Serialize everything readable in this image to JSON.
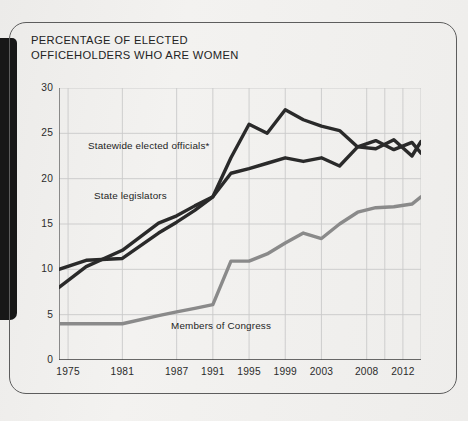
{
  "figure": {
    "title": "PERCENTAGE OF ELECTED\nOFFICEHOLDERS WHO ARE WOMEN",
    "title_line1": "PERCENTAGE OF ELECTED",
    "title_line2": "OFFICEHOLDERS WHO ARE WOMEN"
  },
  "labels": {
    "statewide": "Statewide elected officials*",
    "legislators": "State legislators",
    "congress": "Members of Congress"
  },
  "colors": {
    "dark_line": "#2a2a2a",
    "gray_line": "#8a8a8a",
    "grid": "#c9c9c9",
    "axis": "#6f6f6f",
    "text": "#232323",
    "left_block": "#171717",
    "card_border": "#5d5d5d",
    "background": "#f0efed"
  },
  "chart_data": {
    "type": "line",
    "title": "PERCENTAGE OF ELECTED OFFICEHOLDERS WHO ARE WOMEN",
    "xlabel": "",
    "ylabel": "",
    "xlim": [
      1974,
      2014
    ],
    "ylim": [
      0,
      30
    ],
    "ytick_values": [
      0,
      5,
      10,
      15,
      20,
      25,
      30
    ],
    "ytick_labels": [
      "0",
      "5",
      "10",
      "15",
      "20",
      "25",
      "30"
    ],
    "xtick_values": [
      1975,
      1981,
      1987,
      1991,
      1995,
      1999,
      2003,
      2008,
      2012
    ],
    "xtick_labels": [
      "1975",
      "1981",
      "1987",
      "1991",
      "1995",
      "1999",
      "2003",
      "2008",
      "2012"
    ],
    "grid": true,
    "legend": "inline-annotations",
    "series": [
      {
        "name": "Statewide elected officials*",
        "color": "#2a2a2a",
        "x": [
          1974,
          1977,
          1981,
          1985,
          1987,
          1989,
          1991,
          1993,
          1995,
          1997,
          1999,
          2001,
          2003,
          2005,
          2007,
          2009,
          2011,
          2013,
          2014
        ],
        "values": [
          10.0,
          11.0,
          11.2,
          14.0,
          15.2,
          16.5,
          18.0,
          22.3,
          26.0,
          25.0,
          27.6,
          26.5,
          25.8,
          25.3,
          23.5,
          23.3,
          24.3,
          22.5,
          24.1
        ]
      },
      {
        "name": "State legislators",
        "color": "#2a2a2a",
        "x": [
          1974,
          1977,
          1981,
          1985,
          1987,
          1989,
          1991,
          1993,
          1995,
          1997,
          1999,
          2001,
          2003,
          2005,
          2007,
          2009,
          2011,
          2013,
          2014
        ],
        "values": [
          8.0,
          10.3,
          12.1,
          15.1,
          15.9,
          17.0,
          18.0,
          20.6,
          21.1,
          21.7,
          22.3,
          21.9,
          22.3,
          21.4,
          23.5,
          24.2,
          23.2,
          24.0,
          22.8
        ]
      },
      {
        "name": "Members of Congress",
        "color": "#8a8a8a",
        "x": [
          1974,
          1977,
          1981,
          1985,
          1987,
          1989,
          1991,
          1993,
          1995,
          1997,
          1999,
          2001,
          2003,
          2005,
          2007,
          2009,
          2011,
          2013,
          2014
        ],
        "values": [
          4.0,
          4.0,
          4.0,
          4.9,
          5.3,
          5.7,
          6.1,
          10.9,
          10.9,
          11.7,
          12.9,
          14.0,
          13.4,
          15.0,
          16.3,
          16.8,
          16.9,
          17.2,
          18.0
        ]
      }
    ]
  }
}
